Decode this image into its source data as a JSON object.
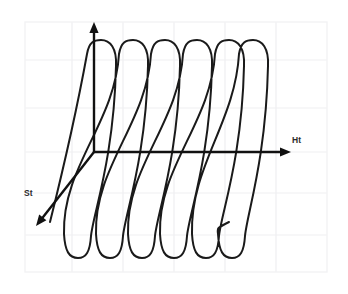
{
  "figure": {
    "background_color": "#ffffff",
    "canvas": {
      "width": 348,
      "height": 294
    }
  },
  "grid": {
    "visible": true,
    "line_color": "#efeff1",
    "frame_color": "#f2f2f4",
    "frame": {
      "x": 25,
      "y": 22,
      "width": 302,
      "height": 250
    },
    "vertical_lines": [
      72,
      123,
      174,
      225,
      276
    ],
    "horizontal_lines": [
      60,
      108,
      152,
      193,
      235
    ]
  },
  "axes": {
    "color": "#111111",
    "vertical": {
      "name": "vertical-axis",
      "label": "",
      "origin": {
        "x": 94,
        "y": 152
      },
      "tip": {
        "x": 94,
        "y": 22
      }
    },
    "horizontal": {
      "name": "ht-axis",
      "label": "Ht",
      "label_position": {
        "x": 292,
        "y": 143
      },
      "origin": {
        "x": 94,
        "y": 152
      },
      "tip": {
        "x": 291,
        "y": 152
      }
    },
    "depth": {
      "name": "st-axis",
      "label": "St",
      "label_position": {
        "x": 24,
        "y": 196
      },
      "origin": {
        "x": 94,
        "y": 152
      },
      "tip": {
        "x": 36,
        "y": 226
      }
    }
  },
  "curve": {
    "name": "helix-coil",
    "stroke_color": "#1a1a1a",
    "stroke_width": 2.0,
    "turns": 6,
    "top_y": 40,
    "bottom_y": 258,
    "loop_half_width": 16,
    "turn_spacing_x": 32,
    "tilt_offset_x": -23,
    "first_top_x": 101,
    "loop_tops_x": [
      101,
      133,
      165,
      197,
      229,
      253
    ],
    "loop_bottoms_x": [
      78,
      110,
      142,
      174,
      206,
      232
    ],
    "start_point": {
      "x": 50,
      "y": 222
    },
    "end_point": {
      "x": 229,
      "y": 222
    }
  }
}
